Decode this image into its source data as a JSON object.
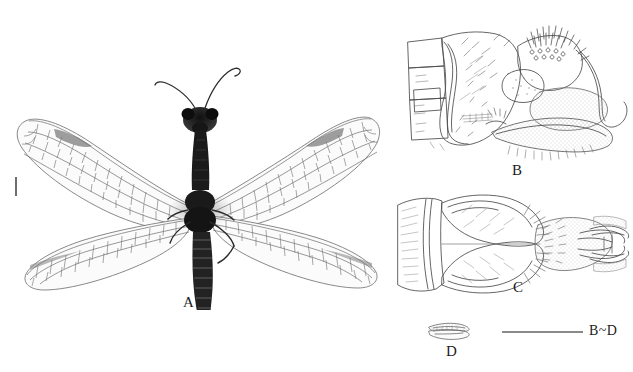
{
  "figure": {
    "type": "scientific-plate",
    "background_color": "#ffffff",
    "ink_color": "#1c1c1c",
    "line_color": "#555555",
    "panels": [
      {
        "id": "A",
        "label": "A",
        "caption": "A",
        "description": "Adult habitus, dorsal view; whole insect with two pairs of wings, elongate prothorax, filiform antennae and segmented abdomen",
        "label_x": 188,
        "label_y": 296
      },
      {
        "id": "B",
        "label": "B",
        "caption": "B",
        "description": "Male terminalia, lateral view; line drawing with setae and membranous areas",
        "label_x": 512,
        "label_y": 162
      },
      {
        "id": "C",
        "label": "C",
        "caption": "C",
        "description": "Male terminalia, ventral view; line drawing with paired gonostyli",
        "label_x": 513,
        "label_y": 287
      },
      {
        "id": "D",
        "label": "D",
        "caption": "D",
        "description": "Detached sclerite, enlarged",
        "label_x": 447,
        "label_y": 348
      }
    ],
    "scale_bars": [
      {
        "name": "habitus-scale-tick",
        "orientation": "vertical",
        "x": 15,
        "y": 177,
        "length": 19,
        "label": ""
      },
      {
        "name": "genitalia-scale-bar",
        "orientation": "horizontal",
        "x": 502,
        "y": 331,
        "length": 81,
        "label": "B~D",
        "label_x": 590,
        "label_y": 324
      }
    ]
  }
}
